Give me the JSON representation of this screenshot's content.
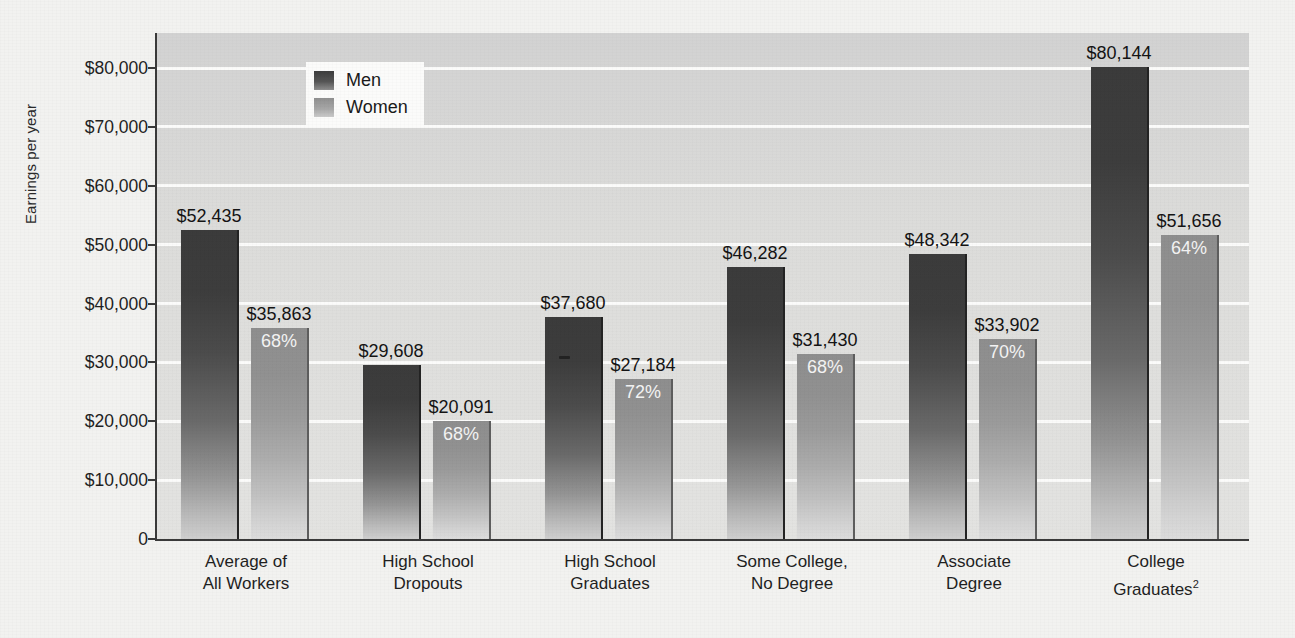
{
  "chart_data": {
    "type": "bar",
    "title": "",
    "xlabel": "",
    "ylabel": "Earnings per year",
    "ylim": [
      0,
      85000
    ],
    "grid": true,
    "legend_position": "top-left-inside",
    "categories": [
      "Average of\nAll Workers",
      "High School\nDropouts",
      "High School\nGraduates",
      "Some College,\nNo Degree",
      "Associate\nDegree",
      "College\nGraduates2"
    ],
    "yticks": [
      {
        "value": 80000,
        "label": "$80,000"
      },
      {
        "value": 70000,
        "label": "$70,000"
      },
      {
        "value": 60000,
        "label": "$60,000"
      },
      {
        "value": 50000,
        "label": "$50,000"
      },
      {
        "value": 40000,
        "label": "$40,000"
      },
      {
        "value": 30000,
        "label": "$30,000"
      },
      {
        "value": 20000,
        "label": "$20,000"
      },
      {
        "value": 10000,
        "label": "$10,000"
      },
      {
        "value": 0,
        "label": "0"
      }
    ],
    "series": [
      {
        "name": "Men",
        "color": "#3d3d3d",
        "values": [
          52435,
          29608,
          37680,
          46282,
          48342,
          80144
        ],
        "labels": [
          "$52,435",
          "$29,608",
          "$37,680",
          "$46,282",
          "$48,342",
          "$80,144"
        ]
      },
      {
        "name": "Women",
        "color": "#9b9b9b",
        "values": [
          35863,
          20091,
          27184,
          31430,
          33902,
          51656
        ],
        "labels": [
          "$35,863",
          "$20,091",
          "$27,184",
          "$31,430",
          "$33,902",
          "$51,656"
        ],
        "pct_of_men": [
          "68%",
          "68%",
          "72%",
          "68%",
          "70%",
          "64%"
        ]
      }
    ]
  },
  "groups": [
    {
      "label_line1": "Average of",
      "label_line2": "All Workers",
      "label_sup": "",
      "men_label": "$52,435",
      "women_label": "$35,863",
      "women_pct": "68%"
    },
    {
      "label_line1": "High School",
      "label_line2": "Dropouts",
      "label_sup": "",
      "men_label": "$29,608",
      "women_label": "$20,091",
      "women_pct": "68%"
    },
    {
      "label_line1": "High School",
      "label_line2": "Graduates",
      "label_sup": "",
      "men_label": "$37,680",
      "women_label": "$27,184",
      "women_pct": "72%"
    },
    {
      "label_line1": "Some College,",
      "label_line2": "No Degree",
      "label_sup": "",
      "men_label": "$46,282",
      "women_label": "$31,430",
      "women_pct": "68%"
    },
    {
      "label_line1": "Associate",
      "label_line2": "Degree",
      "label_sup": "",
      "men_label": "$48,342",
      "women_label": "$33,902",
      "women_pct": "70%"
    },
    {
      "label_line1": "College",
      "label_line2": "Graduates",
      "label_sup": "2",
      "men_label": "$80,144",
      "women_label": "$51,656",
      "women_pct": "64%"
    }
  ],
  "legend": {
    "men": "Men",
    "women": "Women"
  },
  "axis": {
    "ylabel": "Earnings per year"
  },
  "colors": {
    "men_bar": "#3d3d3d",
    "women_bar": "#9b9b9b",
    "plot_background": "#dcdcda",
    "gridline": "#fbfbfa",
    "axis": "#3a3a3a",
    "page_background": "#f2f2f0"
  }
}
